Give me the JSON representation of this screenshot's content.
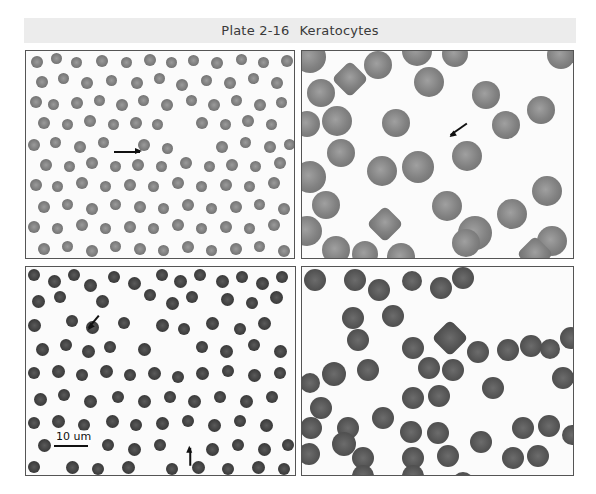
{
  "plate": {
    "number": "Plate 2-16",
    "title": "Keratocytes",
    "band_color": "#ececec"
  },
  "panels": [
    {
      "id": "top-left",
      "description": "Low-magnification blood smear with arrow indicating keratocyte",
      "arrows": [
        {
          "x": 88,
          "y": 100,
          "length": 26,
          "angle": 0
        }
      ],
      "cells": [
        [
          5,
          5,
          12
        ],
        [
          25,
          2,
          11
        ],
        [
          45,
          6,
          11
        ],
        [
          70,
          4,
          12
        ],
        [
          95,
          6,
          11
        ],
        [
          118,
          3,
          12
        ],
        [
          140,
          6,
          11
        ],
        [
          162,
          4,
          11
        ],
        [
          185,
          6,
          12
        ],
        [
          210,
          3,
          11
        ],
        [
          232,
          6,
          11
        ],
        [
          255,
          4,
          12
        ],
        [
          10,
          25,
          12
        ],
        [
          32,
          22,
          11
        ],
        [
          55,
          26,
          12
        ],
        [
          80,
          24,
          11
        ],
        [
          105,
          26,
          12
        ],
        [
          128,
          22,
          11
        ],
        [
          150,
          28,
          12
        ],
        [
          175,
          24,
          11
        ],
        [
          198,
          26,
          12
        ],
        [
          222,
          22,
          11
        ],
        [
          245,
          26,
          12
        ],
        [
          4,
          45,
          12
        ],
        [
          22,
          48,
          11
        ],
        [
          45,
          46,
          12
        ],
        [
          68,
          44,
          11
        ],
        [
          90,
          48,
          12
        ],
        [
          112,
          44,
          11
        ],
        [
          135,
          48,
          12
        ],
        [
          160,
          44,
          11
        ],
        [
          182,
          48,
          12
        ],
        [
          205,
          44,
          11
        ],
        [
          228,
          48,
          12
        ],
        [
          250,
          46,
          11
        ],
        [
          12,
          66,
          12
        ],
        [
          36,
          68,
          11
        ],
        [
          58,
          64,
          12
        ],
        [
          82,
          68,
          11
        ],
        [
          104,
          66,
          12
        ],
        [
          126,
          68,
          11
        ],
        [
          170,
          66,
          12
        ],
        [
          194,
          68,
          11
        ],
        [
          216,
          64,
          12
        ],
        [
          240,
          68,
          11
        ],
        [
          2,
          88,
          12
        ],
        [
          24,
          86,
          11
        ],
        [
          48,
          90,
          12
        ],
        [
          72,
          86,
          11
        ],
        [
          112,
          88,
          12
        ],
        [
          136,
          92,
          11
        ],
        [
          190,
          90,
          12
        ],
        [
          214,
          86,
          11
        ],
        [
          238,
          90,
          12
        ],
        [
          258,
          88,
          11
        ],
        [
          14,
          108,
          12
        ],
        [
          38,
          110,
          11
        ],
        [
          60,
          106,
          12
        ],
        [
          84,
          110,
          11
        ],
        [
          106,
          108,
          12
        ],
        [
          130,
          110,
          11
        ],
        [
          154,
          106,
          12
        ],
        [
          178,
          110,
          11
        ],
        [
          200,
          108,
          12
        ],
        [
          224,
          110,
          11
        ],
        [
          248,
          106,
          12
        ],
        [
          4,
          128,
          12
        ],
        [
          26,
          130,
          11
        ],
        [
          50,
          126,
          12
        ],
        [
          74,
          130,
          11
        ],
        [
          98,
          128,
          12
        ],
        [
          122,
          130,
          11
        ],
        [
          146,
          126,
          12
        ],
        [
          170,
          130,
          11
        ],
        [
          194,
          128,
          12
        ],
        [
          218,
          130,
          11
        ],
        [
          242,
          126,
          12
        ],
        [
          12,
          150,
          12
        ],
        [
          36,
          148,
          11
        ],
        [
          60,
          152,
          12
        ],
        [
          84,
          148,
          11
        ],
        [
          108,
          150,
          12
        ],
        [
          132,
          152,
          11
        ],
        [
          156,
          148,
          12
        ],
        [
          180,
          152,
          11
        ],
        [
          204,
          150,
          12
        ],
        [
          228,
          148,
          11
        ],
        [
          252,
          152,
          12
        ],
        [
          2,
          170,
          12
        ],
        [
          26,
          172,
          11
        ],
        [
          50,
          168,
          12
        ],
        [
          74,
          172,
          11
        ],
        [
          98,
          170,
          12
        ],
        [
          122,
          172,
          11
        ],
        [
          146,
          168,
          12
        ],
        [
          170,
          172,
          11
        ],
        [
          194,
          170,
          12
        ],
        [
          218,
          172,
          11
        ],
        [
          242,
          168,
          12
        ],
        [
          12,
          192,
          12
        ],
        [
          36,
          190,
          11
        ],
        [
          60,
          194,
          12
        ],
        [
          84,
          190,
          11
        ],
        [
          108,
          192,
          12
        ],
        [
          132,
          194,
          11
        ],
        [
          156,
          190,
          12
        ],
        [
          180,
          194,
          11
        ],
        [
          204,
          192,
          12
        ],
        [
          228,
          190,
          11
        ],
        [
          252,
          194,
          12
        ]
      ]
    },
    {
      "id": "top-right",
      "description": "High-magnification smear with arrow indicating keratocyte with horn-like projections",
      "arrows": [
        {
          "x": 165,
          "y": 72,
          "length": 20,
          "angle": 145
        }
      ],
      "cells": [
        [
          -8,
          -10,
          32
        ],
        [
          35,
          15,
          26,
          1
        ],
        [
          62,
          0,
          28
        ],
        [
          100,
          -15,
          30
        ],
        [
          140,
          -10,
          26
        ],
        [
          245,
          -10,
          28
        ],
        [
          5,
          28,
          28
        ],
        [
          112,
          16,
          30
        ],
        [
          170,
          30,
          28
        ],
        [
          225,
          45,
          28
        ],
        [
          -8,
          60,
          26
        ],
        [
          20,
          55,
          30
        ],
        [
          80,
          58,
          28
        ],
        [
          190,
          60,
          28
        ],
        [
          25,
          88,
          28
        ],
        [
          150,
          90,
          30
        ],
        [
          -8,
          110,
          32
        ],
        [
          65,
          105,
          30
        ],
        [
          100,
          100,
          32
        ],
        [
          156,
          165,
          34
        ],
        [
          10,
          140,
          28
        ],
        [
          130,
          140,
          30
        ],
        [
          230,
          125,
          30
        ],
        [
          -10,
          165,
          30
        ],
        [
          70,
          160,
          26,
          1
        ],
        [
          20,
          185,
          28
        ],
        [
          50,
          190,
          26
        ],
        [
          150,
          178,
          28
        ],
        [
          195,
          148,
          30
        ],
        [
          235,
          175,
          30
        ],
        [
          85,
          192,
          28
        ],
        [
          220,
          190,
          26,
          1
        ]
      ]
    },
    {
      "id": "bottom-left",
      "description": "Blood smear with two arrows indicating keratocytes and 10 um scale bar",
      "scale_bar": "10 um",
      "arrows": [
        {
          "x": 73,
          "y": 48,
          "length": 16,
          "angle": 130
        },
        {
          "x": 164,
          "y": 198,
          "length": 18,
          "angle": -90
        }
      ],
      "cells": [
        [
          2,
          2,
          12
        ],
        [
          22,
          8,
          13
        ],
        [
          42,
          2,
          12
        ],
        [
          58,
          12,
          13
        ],
        [
          82,
          4,
          12
        ],
        [
          102,
          10,
          13
        ],
        [
          130,
          2,
          12
        ],
        [
          148,
          8,
          13
        ],
        [
          168,
          2,
          12
        ],
        [
          190,
          8,
          13
        ],
        [
          210,
          4,
          12
        ],
        [
          230,
          10,
          13
        ],
        [
          250,
          4,
          12
        ],
        [
          6,
          28,
          13
        ],
        [
          28,
          24,
          12
        ],
        [
          70,
          28,
          13
        ],
        [
          118,
          22,
          12
        ],
        [
          140,
          30,
          13
        ],
        [
          160,
          24,
          12
        ],
        [
          195,
          26,
          13
        ],
        [
          220,
          30,
          12
        ],
        [
          244,
          24,
          13
        ],
        [
          2,
          52,
          13
        ],
        [
          40,
          48,
          12
        ],
        [
          60,
          54,
          13
        ],
        [
          92,
          50,
          12
        ],
        [
          130,
          52,
          13
        ],
        [
          152,
          56,
          12
        ],
        [
          180,
          50,
          13
        ],
        [
          208,
          56,
          12
        ],
        [
          232,
          50,
          13
        ],
        [
          10,
          76,
          13
        ],
        [
          34,
          72,
          12
        ],
        [
          56,
          78,
          13
        ],
        [
          78,
          74,
          12
        ],
        [
          112,
          76,
          13
        ],
        [
          170,
          74,
          12
        ],
        [
          194,
          78,
          13
        ],
        [
          222,
          72,
          12
        ],
        [
          248,
          78,
          13
        ],
        [
          2,
          100,
          12
        ],
        [
          26,
          98,
          13
        ],
        [
          50,
          102,
          12
        ],
        [
          74,
          98,
          13
        ],
        [
          98,
          102,
          12
        ],
        [
          122,
          100,
          13
        ],
        [
          146,
          104,
          12
        ],
        [
          170,
          100,
          13
        ],
        [
          196,
          98,
          12
        ],
        [
          222,
          102,
          13
        ],
        [
          248,
          100,
          12
        ],
        [
          8,
          126,
          13
        ],
        [
          32,
          122,
          12
        ],
        [
          58,
          128,
          13
        ],
        [
          86,
          124,
          12
        ],
        [
          112,
          128,
          13
        ],
        [
          138,
          124,
          12
        ],
        [
          162,
          128,
          13
        ],
        [
          188,
          124,
          12
        ],
        [
          214,
          128,
          13
        ],
        [
          240,
          124,
          12
        ],
        [
          2,
          150,
          12
        ],
        [
          26,
          148,
          13
        ],
        [
          52,
          152,
          12
        ],
        [
          80,
          148,
          13
        ],
        [
          104,
          152,
          12
        ],
        [
          130,
          150,
          13
        ],
        [
          156,
          148,
          12
        ],
        [
          182,
          152,
          13
        ],
        [
          208,
          148,
          12
        ],
        [
          234,
          152,
          13
        ],
        [
          12,
          172,
          13
        ],
        [
          76,
          172,
          12
        ],
        [
          102,
          176,
          13
        ],
        [
          128,
          172,
          12
        ],
        [
          180,
          176,
          13
        ],
        [
          206,
          172,
          12
        ],
        [
          232,
          176,
          13
        ],
        [
          256,
          172,
          12
        ],
        [
          2,
          194,
          12
        ],
        [
          40,
          194,
          13
        ],
        [
          66,
          196,
          12
        ],
        [
          96,
          194,
          13
        ],
        [
          140,
          196,
          12
        ],
        [
          166,
          194,
          13
        ],
        [
          196,
          196,
          12
        ],
        [
          226,
          194,
          13
        ],
        [
          252,
          196,
          12
        ]
      ]
    },
    {
      "id": "bottom-right",
      "description": "Blood smear with multiple keratocytes showing paired projections",
      "arrows": [],
      "cells": [
        [
          2,
          2,
          22
        ],
        [
          42,
          2,
          22
        ],
        [
          100,
          4,
          20
        ],
        [
          128,
          10,
          22
        ],
        [
          150,
          0,
          22
        ],
        [
          66,
          12,
          22
        ],
        [
          40,
          40,
          22
        ],
        [
          80,
          38,
          22
        ],
        [
          45,
          62,
          22
        ],
        [
          100,
          70,
          22
        ],
        [
          135,
          58,
          26,
          1
        ],
        [
          165,
          74,
          22
        ],
        [
          195,
          72,
          22
        ],
        [
          218,
          68,
          22
        ],
        [
          238,
          72,
          20
        ],
        [
          258,
          60,
          22
        ],
        [
          20,
          95,
          24
        ],
        [
          55,
          92,
          22
        ],
        [
          116,
          90,
          22
        ],
        [
          140,
          92,
          22
        ],
        [
          180,
          110,
          22
        ],
        [
          250,
          100,
          22
        ],
        [
          -2,
          106,
          20
        ],
        [
          8,
          130,
          22
        ],
        [
          100,
          120,
          22
        ],
        [
          126,
          118,
          22
        ],
        [
          -2,
          150,
          22
        ],
        [
          35,
          150,
          22
        ],
        [
          70,
          140,
          22
        ],
        [
          30,
          165,
          24
        ],
        [
          98,
          154,
          22
        ],
        [
          125,
          155,
          22
        ],
        [
          168,
          164,
          22
        ],
        [
          210,
          150,
          22
        ],
        [
          236,
          148,
          22
        ],
        [
          260,
          158,
          20
        ],
        [
          -4,
          176,
          22
        ],
        [
          50,
          180,
          22
        ],
        [
          100,
          180,
          22
        ],
        [
          135,
          178,
          22
        ],
        [
          200,
          180,
          22
        ],
        [
          225,
          178,
          22
        ],
        [
          50,
          198,
          22
        ],
        [
          100,
          198,
          22
        ],
        [
          150,
          205,
          22
        ]
      ]
    }
  ]
}
